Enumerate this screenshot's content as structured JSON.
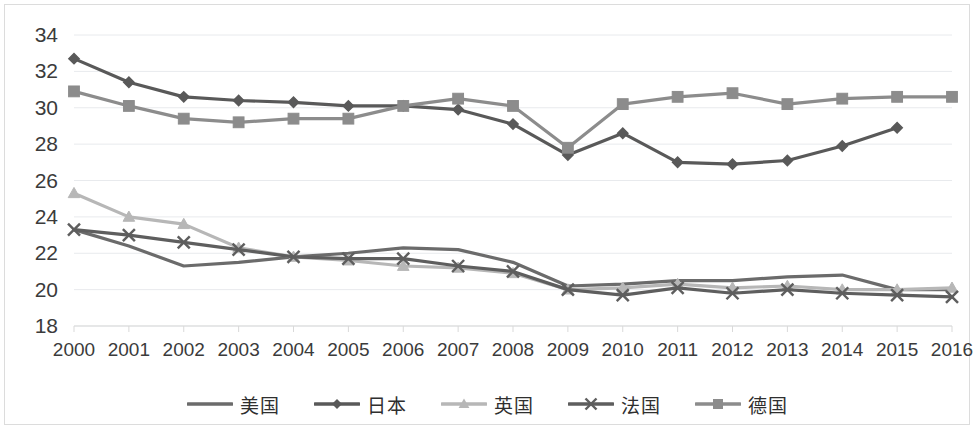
{
  "chart_data": {
    "type": "line",
    "title": "",
    "subtitle": "",
    "xlabel": "",
    "ylabel": "",
    "grid": true,
    "legend_position": "bottom",
    "x": [
      2000,
      2001,
      2002,
      2003,
      2004,
      2005,
      2006,
      2007,
      2008,
      2009,
      2010,
      2011,
      2012,
      2013,
      2014,
      2015,
      2016
    ],
    "categories": [
      "2000",
      "2001",
      "2002",
      "2003",
      "2004",
      "2005",
      "2006",
      "2007",
      "2008",
      "2009",
      "2010",
      "2011",
      "2012",
      "2013",
      "2014",
      "2015",
      "2016"
    ],
    "ylim": [
      18,
      34
    ],
    "yticks": [
      18,
      20,
      22,
      24,
      26,
      28,
      30,
      32,
      34
    ],
    "ytick_labels": [
      "18",
      "20",
      "22",
      "24",
      "26",
      "28",
      "30",
      "32",
      "34"
    ],
    "series": [
      {
        "name": "美国",
        "marker": "none",
        "color": "#6b6b6b",
        "values": [
          23.3,
          22.4,
          21.3,
          21.5,
          21.8,
          22.0,
          22.3,
          22.2,
          21.5,
          20.2,
          20.3,
          20.5,
          20.5,
          20.7,
          20.8,
          20.0,
          20.0
        ]
      },
      {
        "name": "日本",
        "marker": "diamond",
        "color": "#595959",
        "values": [
          32.7,
          31.4,
          30.6,
          30.4,
          30.3,
          30.1,
          30.1,
          29.9,
          29.1,
          27.4,
          28.6,
          27.0,
          26.9,
          27.1,
          27.9,
          28.9,
          null
        ]
      },
      {
        "name": "英国",
        "marker": "triangle",
        "color": "#b7b7b7",
        "values": [
          25.3,
          24.0,
          23.6,
          22.3,
          21.8,
          21.6,
          21.3,
          21.2,
          20.9,
          20.0,
          20.1,
          20.3,
          20.1,
          20.2,
          20.0,
          20.0,
          20.1
        ]
      },
      {
        "name": "法国",
        "marker": "cross",
        "color": "#5e5e5e",
        "values": [
          23.3,
          23.0,
          22.6,
          22.2,
          21.8,
          21.7,
          21.7,
          21.3,
          21.0,
          20.0,
          19.7,
          20.1,
          19.8,
          20.0,
          19.8,
          19.7,
          19.6
        ]
      },
      {
        "name": "德国",
        "marker": "square",
        "color": "#8c8c8c",
        "values": [
          30.9,
          30.1,
          29.4,
          29.2,
          29.4,
          29.4,
          30.1,
          30.5,
          30.1,
          27.8,
          30.2,
          30.6,
          30.8,
          30.2,
          30.5,
          30.6,
          30.6
        ]
      }
    ]
  },
  "legend": {
    "items": [
      {
        "label": "美国",
        "marker": "none",
        "color": "#6b6b6b"
      },
      {
        "label": "日本",
        "marker": "diamond",
        "color": "#595959"
      },
      {
        "label": "英国",
        "marker": "triangle",
        "color": "#b7b7b7"
      },
      {
        "label": "法国",
        "marker": "cross",
        "color": "#5e5e5e"
      },
      {
        "label": "德国",
        "marker": "square",
        "color": "#8c8c8c"
      }
    ]
  },
  "axis": {
    "y_labels": [
      "34",
      "32",
      "30",
      "28",
      "26",
      "24",
      "22",
      "20",
      "18"
    ],
    "x_labels": [
      "2000",
      "2001",
      "2002",
      "2003",
      "2004",
      "2005",
      "2006",
      "2007",
      "2008",
      "2009",
      "2010",
      "2011",
      "2012",
      "2013",
      "2014",
      "2015",
      "2016"
    ]
  }
}
